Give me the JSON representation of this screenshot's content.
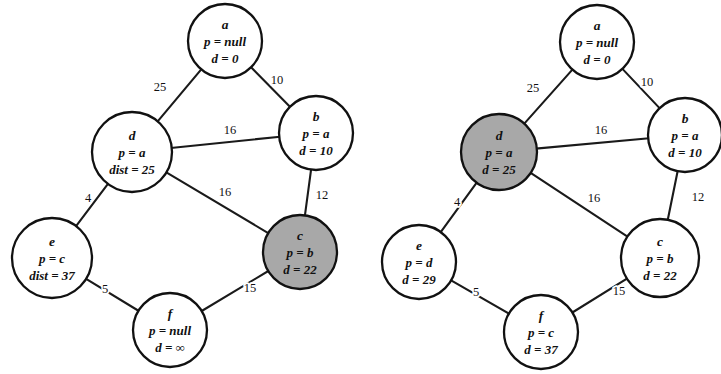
{
  "figure": {
    "background_color": "#ffffff",
    "stroke_color": "#111111",
    "highlight_fill": "#a8a8a8",
    "node_fill": "#ffffff"
  },
  "diagrams": [
    {
      "id": "left",
      "name": "graph-step-left",
      "nodes": [
        {
          "id": "a",
          "label": "a",
          "parent_text": "p = null",
          "dist_text": "d = 0",
          "cx": 225,
          "cy": 41,
          "r": 37,
          "highlighted": false
        },
        {
          "id": "b",
          "label": "b",
          "parent_text": "p = a",
          "dist_text": "d = 10",
          "cx": 316,
          "cy": 133,
          "r": 37,
          "highlighted": false
        },
        {
          "id": "d",
          "label": "d",
          "parent_text": "p = a",
          "dist_text": "dist = 25",
          "cx": 132,
          "cy": 152,
          "r": 40,
          "highlighted": false
        },
        {
          "id": "c",
          "label": "c",
          "parent_text": "p = b",
          "dist_text": "d = 22",
          "cx": 300,
          "cy": 252,
          "r": 37,
          "highlighted": true
        },
        {
          "id": "e",
          "label": "e",
          "parent_text": "p = c",
          "dist_text": "dist = 37",
          "cx": 52,
          "cy": 258,
          "r": 40,
          "highlighted": false
        },
        {
          "id": "f",
          "label": "f",
          "parent_text": "p = null",
          "dist_text": "d = ∞",
          "cx": 170,
          "cy": 330,
          "r": 37,
          "highlighted": false
        }
      ],
      "edges": [
        {
          "from": "a",
          "to": "d",
          "weight": "25",
          "lx": 160,
          "ly": 88
        },
        {
          "from": "a",
          "to": "b",
          "weight": "10",
          "lx": 277,
          "ly": 81
        },
        {
          "from": "d",
          "to": "b",
          "weight": "16",
          "lx": 230,
          "ly": 131
        },
        {
          "from": "b",
          "to": "c",
          "weight": "12",
          "lx": 322,
          "ly": 196
        },
        {
          "from": "d",
          "to": "c",
          "weight": "16",
          "lx": 225,
          "ly": 193
        },
        {
          "from": "d",
          "to": "e",
          "weight": "4",
          "lx": 88,
          "ly": 199
        },
        {
          "from": "e",
          "to": "f",
          "weight": "5",
          "lx": 105,
          "ly": 290
        },
        {
          "from": "f",
          "to": "c",
          "weight": "15",
          "lx": 250,
          "ly": 289
        }
      ]
    },
    {
      "id": "right",
      "name": "graph-step-right",
      "nodes": [
        {
          "id": "a",
          "label": "a",
          "parent_text": "p = null",
          "dist_text": "d = 0",
          "cx": 236,
          "cy": 42,
          "r": 37,
          "highlighted": false
        },
        {
          "id": "b",
          "label": "b",
          "parent_text": "p = a",
          "dist_text": "d = 10",
          "cx": 324,
          "cy": 135,
          "r": 37,
          "highlighted": false
        },
        {
          "id": "d",
          "label": "d",
          "parent_text": "p = a",
          "dist_text": "d = 25",
          "cx": 138,
          "cy": 152,
          "r": 38,
          "highlighted": true
        },
        {
          "id": "c",
          "label": "c",
          "parent_text": "p = b",
          "dist_text": "d = 22",
          "cx": 299,
          "cy": 258,
          "r": 39,
          "highlighted": false
        },
        {
          "id": "e",
          "label": "e",
          "parent_text": "p = d",
          "dist_text": "d = 29",
          "cx": 58,
          "cy": 262,
          "r": 37,
          "highlighted": false
        },
        {
          "id": "f",
          "label": "f",
          "parent_text": "p = c",
          "dist_text": "d = 37",
          "cx": 180,
          "cy": 332,
          "r": 37,
          "highlighted": false
        }
      ],
      "edges": [
        {
          "from": "a",
          "to": "d",
          "weight": "25",
          "lx": 172,
          "ly": 89
        },
        {
          "from": "a",
          "to": "b",
          "weight": "10",
          "lx": 286,
          "ly": 83
        },
        {
          "from": "d",
          "to": "b",
          "weight": "16",
          "lx": 240,
          "ly": 131
        },
        {
          "from": "b",
          "to": "c",
          "weight": "12",
          "lx": 337,
          "ly": 198
        },
        {
          "from": "d",
          "to": "c",
          "weight": "16",
          "lx": 233,
          "ly": 199
        },
        {
          "from": "d",
          "to": "e",
          "weight": "4",
          "lx": 96,
          "ly": 203
        },
        {
          "from": "e",
          "to": "f",
          "weight": "5",
          "lx": 115,
          "ly": 293
        },
        {
          "from": "f",
          "to": "c",
          "weight": "15",
          "lx": 258,
          "ly": 292
        }
      ]
    }
  ]
}
